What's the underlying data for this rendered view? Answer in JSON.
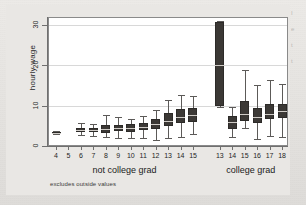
{
  "figure": {
    "note": "excludes outside values",
    "y_title": "hourly wage",
    "group_labels": [
      "not college grad",
      "college grad"
    ],
    "margin_fragments": [
      "I",
      "e",
      "t",
      "t"
    ]
  },
  "chart_data": {
    "type": "box",
    "title": "",
    "xlabel": "",
    "ylabel": "hourly wage",
    "ylim": [
      0,
      32
    ],
    "yticks": [
      0,
      10,
      20,
      30
    ],
    "ytick_labels": [
      "0",
      "10",
      "20",
      "30"
    ],
    "grid": true,
    "legend": "none",
    "groups": [
      {
        "name": "not college grad",
        "categories": [
          "4",
          "5",
          "6",
          "7",
          "8",
          "9",
          "10",
          "11",
          "12",
          "13",
          "14",
          "15"
        ]
      },
      {
        "name": "college grad",
        "categories": [
          "13",
          "14",
          "15",
          "16",
          "17",
          "18"
        ]
      }
    ],
    "boxes": [
      {
        "group": "not college grad",
        "x": "4",
        "min": 3.1,
        "q1": 3.2,
        "median": 3.3,
        "q3": 3.5,
        "max": 3.6
      },
      {
        "group": "not college grad",
        "x": "5",
        "min": null,
        "q1": null,
        "median": null,
        "q3": null,
        "max": null
      },
      {
        "group": "not college grad",
        "x": "6",
        "min": 2.7,
        "q1": 3.5,
        "median": 4.0,
        "q3": 4.4,
        "max": 5.6
      },
      {
        "group": "not college grad",
        "x": "7",
        "min": 2.4,
        "q1": 3.4,
        "median": 3.9,
        "q3": 4.5,
        "max": 5.5
      },
      {
        "group": "not college grad",
        "x": "8",
        "min": 2.2,
        "q1": 3.3,
        "median": 4.2,
        "q3": 5.3,
        "max": 7.6
      },
      {
        "group": "not college grad",
        "x": "9",
        "min": 2.1,
        "q1": 3.6,
        "median": 4.4,
        "q3": 5.3,
        "max": 7.2
      },
      {
        "group": "not college grad",
        "x": "10",
        "min": 2.0,
        "q1": 3.4,
        "median": 4.4,
        "q3": 5.4,
        "max": 6.6
      },
      {
        "group": "not college grad",
        "x": "11",
        "min": 1.9,
        "q1": 4.0,
        "median": 4.8,
        "q3": 5.7,
        "max": 7.4
      },
      {
        "group": "not college grad",
        "x": "12",
        "min": 1.5,
        "q1": 4.3,
        "median": 5.5,
        "q3": 6.6,
        "max": 9.0
      },
      {
        "group": "not college grad",
        "x": "13",
        "min": 2.0,
        "q1": 5.0,
        "median": 6.2,
        "q3": 8.1,
        "max": 11.4
      },
      {
        "group": "not college grad",
        "x": "14",
        "min": 2.3,
        "q1": 5.6,
        "median": 7.3,
        "q3": 9.2,
        "max": 12.7
      },
      {
        "group": "not college grad",
        "x": "15",
        "min": 3.0,
        "q1": 5.9,
        "median": 7.8,
        "q3": 9.4,
        "max": 12.3
      },
      {
        "group": "college grad",
        "x": "13",
        "min": 9.6,
        "q1": 9.8,
        "median": 20.2,
        "q3": 30.8,
        "max": 31.0
      },
      {
        "group": "college grad",
        "x": "14",
        "min": 2.3,
        "q1": 4.3,
        "median": 5.9,
        "q3": 7.4,
        "max": 9.6
      },
      {
        "group": "college grad",
        "x": "15",
        "min": 4.4,
        "q1": 6.3,
        "median": 8.0,
        "q3": 11.2,
        "max": 18.8
      },
      {
        "group": "college grad",
        "x": "16",
        "min": 1.8,
        "q1": 5.7,
        "median": 7.1,
        "q3": 9.5,
        "max": 15.1
      },
      {
        "group": "college grad",
        "x": "17",
        "min": 2.5,
        "q1": 6.6,
        "median": 7.9,
        "q3": 10.3,
        "max": 16.3
      },
      {
        "group": "college grad",
        "x": "18",
        "min": 2.2,
        "q1": 6.9,
        "median": 8.6,
        "q3": 10.3,
        "max": 15.4
      }
    ]
  }
}
